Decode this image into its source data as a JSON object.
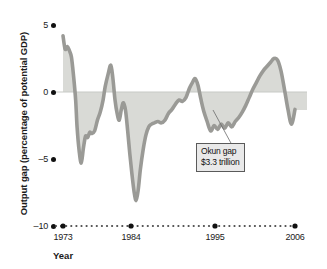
{
  "chart_data": {
    "type": "line",
    "title": "",
    "subtitle": "",
    "xlabel": "Year",
    "ylabel": "Output gap (percentage of potential GDP)",
    "xlim": [
      1973,
      2006
    ],
    "ylim": [
      -10,
      5
    ],
    "yticks": [
      5,
      0,
      -5,
      -10
    ],
    "ytick_labels": [
      "5",
      "0",
      "–5",
      "–10"
    ],
    "xticks": [
      1973,
      1984,
      1995,
      2006
    ],
    "xtick_labels": [
      "1973",
      "1984",
      "1995",
      "2006"
    ],
    "grid": false,
    "legend": null,
    "zero_reference_line": 0,
    "shaded_region": {
      "label": "Okun gap",
      "between": "curve and zero line where output gap is negative",
      "color": "#d9dad6"
    },
    "series": [
      {
        "name": "Output gap",
        "color": "#9a9a96",
        "x": [
          1973.0,
          1973.3,
          1973.6,
          1973.9,
          1974.2,
          1974.5,
          1974.8,
          1975.0,
          1975.3,
          1975.6,
          1975.9,
          1976.2,
          1976.5,
          1976.8,
          1977.1,
          1977.5,
          1977.9,
          1978.3,
          1978.7,
          1979.0,
          1979.4,
          1979.8,
          1980.1,
          1980.4,
          1980.7,
          1981.0,
          1981.3,
          1981.6,
          1981.9,
          1982.2,
          1982.5,
          1982.8,
          1983.1,
          1983.4,
          1983.7,
          1984.0,
          1984.4,
          1984.8,
          1985.2,
          1985.6,
          1986.0,
          1986.5,
          1987.0,
          1987.5,
          1988.0,
          1988.5,
          1989.0,
          1989.5,
          1990.0,
          1990.5,
          1991.0,
          1991.4,
          1991.8,
          1992.2,
          1992.6,
          1993.0,
          1993.5,
          1994.0,
          1994.5,
          1995.0,
          1995.5,
          1996.0,
          1996.5,
          1997.0,
          1997.5,
          1998.0,
          1998.5,
          1999.0,
          1999.5,
          2000.0,
          2000.5,
          2001.0,
          2001.5,
          2002.0,
          2002.5,
          2003.0,
          2003.5,
          2004.0,
          2004.5,
          2005.0,
          2005.5,
          2006.0
        ],
        "values": [
          4.2,
          3.2,
          3.4,
          3.1,
          2.6,
          1.2,
          -0.6,
          -2.6,
          -4.4,
          -5.3,
          -4.2,
          -3.3,
          -3.4,
          -3.0,
          -3.1,
          -2.9,
          -2.1,
          -1.5,
          -0.6,
          0.4,
          1.3,
          2.0,
          1.0,
          -0.6,
          -1.6,
          -2.1,
          -1.3,
          -0.8,
          -1.4,
          -2.9,
          -4.6,
          -6.1,
          -7.4,
          -8.1,
          -7.3,
          -5.8,
          -4.3,
          -3.2,
          -2.6,
          -2.4,
          -2.3,
          -2.2,
          -2.3,
          -2.1,
          -1.6,
          -1.3,
          -0.9,
          -0.6,
          -0.7,
          -0.4,
          0.3,
          0.7,
          1.0,
          0.5,
          -0.5,
          -1.4,
          -2.2,
          -2.9,
          -2.5,
          -2.8,
          -2.4,
          -2.7,
          -2.3,
          -2.6,
          -2.2,
          -1.9,
          -1.5,
          -1.0,
          -0.4,
          0.2,
          0.7,
          1.2,
          1.6,
          1.9,
          2.2,
          2.5,
          2.4,
          1.6,
          0.2,
          -1.3,
          -2.4,
          -1.3
        ]
      }
    ],
    "annotations": [
      {
        "name": "okun-gap-callout",
        "lines": [
          "Okun gap",
          "$3.3 trillion"
        ],
        "points_to_x": 1994.0,
        "points_to_y": -1.0
      }
    ]
  },
  "axis": {
    "y_label": "Output gap (percentage of potential GDP)",
    "x_label": "Year",
    "y_ticks": [
      "5",
      "0",
      "–5",
      "–10"
    ],
    "x_ticks": [
      "1973",
      "1984",
      "1995",
      "2006"
    ]
  },
  "callout": {
    "line1": "Okun gap",
    "line2": "$3.3 trillion"
  },
  "colors": {
    "curve": "#9a9a96",
    "shading": "#d9dad6",
    "axis": "#111111",
    "text": "#1a1a1a",
    "callout_bg": "#e9e9e9",
    "callout_border": "#5a5a5a",
    "background": "#ffffff"
  }
}
